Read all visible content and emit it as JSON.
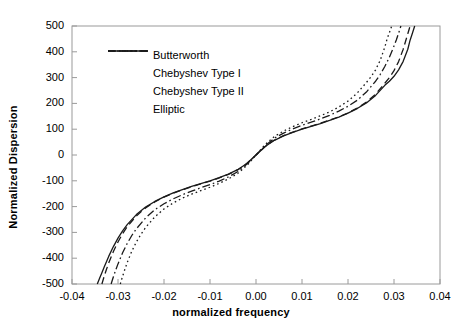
{
  "chart_data": {
    "type": "line",
    "title": "",
    "xlabel": "normalized frequency",
    "ylabel": "Normalized Dispersion",
    "xlim": [
      -0.04,
      0.04
    ],
    "ylim": [
      -500,
      500
    ],
    "xticks": [
      -0.04,
      -0.03,
      -0.02,
      -0.01,
      0.0,
      0.01,
      0.02,
      0.03,
      0.04
    ],
    "xticklabels": [
      "-0.04",
      "-0.03",
      "-0.02",
      "-0.01",
      "0.00",
      "0.01",
      "0.02",
      "0.03",
      "0.04"
    ],
    "yticks": [
      -500,
      -400,
      -300,
      -200,
      -100,
      0,
      100,
      200,
      300,
      400,
      500
    ],
    "yticklabels": [
      "-500",
      "-400",
      "-300",
      "-200",
      "-100",
      "0",
      "100",
      "200",
      "300",
      "400",
      "500"
    ],
    "grid": false,
    "legend_position": "upper-left-inside",
    "line_color": "#1a1a1a",
    "series": [
      {
        "name": "Butterworth",
        "style": "solid",
        "x": [
          -0.0345,
          -0.034,
          -0.0335,
          -0.033,
          -0.032,
          -0.031,
          -0.03,
          -0.029,
          -0.028,
          -0.026,
          -0.024,
          -0.022,
          -0.02,
          -0.018,
          -0.016,
          -0.014,
          -0.012,
          -0.01,
          -0.008,
          -0.006,
          -0.004,
          -0.002,
          0.0,
          0.002,
          0.004,
          0.006,
          0.008,
          0.01,
          0.012,
          0.014,
          0.016,
          0.018,
          0.02,
          0.022,
          0.024,
          0.026,
          0.028,
          0.029,
          0.03,
          0.031,
          0.032,
          0.033,
          0.0335,
          0.034,
          0.0345
        ],
        "y": [
          -500,
          -478,
          -456,
          -434,
          -392,
          -355,
          -322,
          -294,
          -270,
          -231,
          -202,
          -180,
          -162,
          -147,
          -134,
          -122,
          -111,
          -100,
          -88,
          -74,
          -57,
          -33,
          0,
          33,
          57,
          74,
          88,
          100,
          111,
          122,
          134,
          147,
          162,
          180,
          202,
          231,
          270,
          286,
          305,
          330,
          363,
          410,
          445,
          472,
          500
        ]
      },
      {
        "name": "Chebyshev Type I",
        "style": "dashed",
        "x": [
          -0.0335,
          -0.033,
          -0.0325,
          -0.032,
          -0.031,
          -0.03,
          -0.029,
          -0.028,
          -0.026,
          -0.024,
          -0.022,
          -0.02,
          -0.018,
          -0.016,
          -0.014,
          -0.012,
          -0.01,
          -0.008,
          -0.006,
          -0.004,
          -0.002,
          0.0,
          0.002,
          0.004,
          0.006,
          0.008,
          0.01,
          0.012,
          0.014,
          0.016,
          0.018,
          0.02,
          0.022,
          0.024,
          0.026,
          0.028,
          0.029,
          0.03,
          0.031,
          0.032,
          0.0325,
          0.033,
          0.0335
        ],
        "y": [
          -500,
          -470,
          -443,
          -418,
          -374,
          -337,
          -305,
          -278,
          -236,
          -205,
          -182,
          -163,
          -148,
          -135,
          -123,
          -112,
          -101,
          -89,
          -75,
          -58,
          -33,
          0,
          33,
          58,
          75,
          89,
          101,
          112,
          123,
          135,
          148,
          163,
          182,
          205,
          236,
          278,
          300,
          327,
          362,
          410,
          440,
          470,
          500
        ]
      },
      {
        "name": "Chebyshev Type II",
        "style": "dotted",
        "x": [
          -0.0295,
          -0.029,
          -0.0285,
          -0.028,
          -0.027,
          -0.026,
          -0.025,
          -0.024,
          -0.022,
          -0.02,
          -0.018,
          -0.016,
          -0.014,
          -0.012,
          -0.01,
          -0.008,
          -0.006,
          -0.004,
          -0.002,
          0.0,
          0.002,
          0.004,
          0.006,
          0.008,
          0.01,
          0.012,
          0.014,
          0.016,
          0.018,
          0.02,
          0.022,
          0.024,
          0.025,
          0.026,
          0.027,
          0.028,
          0.0285,
          0.029,
          0.0295
        ],
        "y": [
          -500,
          -470,
          -443,
          -417,
          -373,
          -337,
          -307,
          -281,
          -240,
          -209,
          -186,
          -167,
          -152,
          -138,
          -125,
          -110,
          -93,
          -72,
          -41,
          0,
          41,
          72,
          93,
          110,
          125,
          138,
          152,
          167,
          186,
          209,
          240,
          281,
          303,
          330,
          367,
          418,
          450,
          474,
          500
        ]
      },
      {
        "name": "Elliptic",
        "style": "dashdot",
        "x": [
          -0.0315,
          -0.031,
          -0.0305,
          -0.03,
          -0.029,
          -0.028,
          -0.027,
          -0.026,
          -0.024,
          -0.022,
          -0.02,
          -0.018,
          -0.016,
          -0.014,
          -0.012,
          -0.01,
          -0.008,
          -0.006,
          -0.004,
          -0.002,
          0.0,
          0.002,
          0.004,
          0.006,
          0.008,
          0.01,
          0.012,
          0.014,
          0.016,
          0.018,
          0.02,
          0.022,
          0.024,
          0.026,
          0.027,
          0.028,
          0.029,
          0.03,
          0.0305,
          0.031,
          0.0315
        ],
        "y": [
          -500,
          -472,
          -446,
          -422,
          -379,
          -343,
          -312,
          -286,
          -244,
          -212,
          -189,
          -170,
          -154,
          -140,
          -127,
          -115,
          -101,
          -85,
          -65,
          -36,
          0,
          36,
          65,
          85,
          101,
          115,
          127,
          140,
          154,
          170,
          189,
          212,
          244,
          286,
          312,
          343,
          379,
          422,
          446,
          472,
          500
        ]
      }
    ]
  },
  "legend": {
    "items": [
      {
        "label": "Butterworth"
      },
      {
        "label": "Chebyshev Type I"
      },
      {
        "label": "Chebyshev Type II"
      },
      {
        "label": "Elliptic"
      }
    ]
  }
}
